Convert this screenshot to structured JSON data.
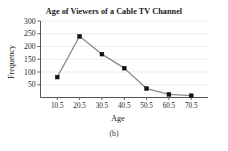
{
  "figure": {
    "caption": "(b)",
    "title": "Age of Viewers of a Cable TV Channel"
  },
  "colors": {
    "line": "#8c8c8c",
    "marker": "#111111",
    "grid": "#e8e8e8",
    "axis": "#555555",
    "text": "#1a1a1a"
  },
  "chart_data": {
    "type": "line",
    "title": "Age of Viewers of a Cable TV Channel",
    "xlabel": "Age",
    "ylabel": "Frequency",
    "x": [
      10.5,
      20.5,
      30.5,
      40.5,
      50.5,
      60.5,
      70.5
    ],
    "values": [
      80,
      240,
      170,
      115,
      35,
      12,
      7
    ],
    "categories": [
      "10.5",
      "20.5",
      "30.5",
      "40.5",
      "50.5",
      "60.5",
      "70.5"
    ],
    "xtick_labels": [
      "10.5",
      "20.5",
      "30.5",
      "40.5",
      "50.5",
      "60.5",
      "70.5"
    ],
    "ytick_labels": [
      "300",
      "250",
      "200",
      "150",
      "100",
      "50"
    ],
    "yticks": [
      300,
      250,
      200,
      150,
      100,
      50
    ],
    "ylim": [
      0,
      300
    ],
    "xlim": [
      3.0,
      78.0
    ],
    "grid": true,
    "legend": "none",
    "marker": "square",
    "series": [
      {
        "name": "Frequency",
        "values": [
          80,
          240,
          170,
          115,
          35,
          12,
          7
        ]
      }
    ]
  }
}
